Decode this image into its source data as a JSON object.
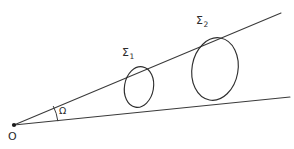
{
  "figure": {
    "background_color": "#ffffff",
    "stroke_color": "#3a3a3a",
    "width": 294,
    "height": 149,
    "labels": {
      "origin": "O",
      "angle": "Ω",
      "surface1_symbol": "Σ",
      "surface1_subscript": "1",
      "surface2_symbol": "Σ",
      "surface2_subscript": "2"
    },
    "geometry": {
      "apex": {
        "x": 14,
        "y": 125
      },
      "upper_ray": {
        "x1": 14,
        "y1": 125,
        "x2": 281,
        "y2": 13
      },
      "lower_ray": {
        "x1": 14,
        "y1": 125,
        "x2": 290,
        "y2": 97
      },
      "angle_arc": {
        "radius": 44,
        "start_x": 57,
        "start_y": 121,
        "end_x": 54,
        "end_y": 107
      },
      "cross_sections": [
        {
          "name": "Σ₁",
          "center_x": 139,
          "center_y": 87,
          "radius_x": 14.5,
          "radius_y": 20.5,
          "rotation_deg": 10
        },
        {
          "name": "Σ₂",
          "center_x": 215,
          "center_y": 69,
          "radius_x": 23,
          "radius_y": 31.5,
          "rotation_deg": 10
        }
      ]
    }
  }
}
